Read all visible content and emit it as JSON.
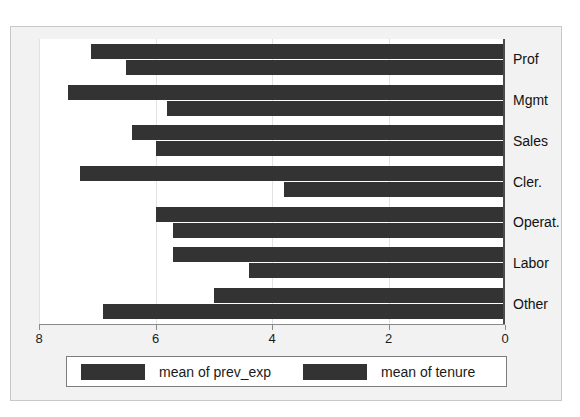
{
  "page": {
    "clipped_text_above": "of of of of of of"
  },
  "chart_data": {
    "type": "bar",
    "orientation": "horizontal",
    "title": "",
    "subtitle": "",
    "xlabel": "",
    "ylabel": "",
    "categories": [
      "Prof",
      "Mgmt",
      "Sales",
      "Cler.",
      "Operat.",
      "Labor",
      "Other"
    ],
    "series": [
      {
        "name": "mean of prev_exp",
        "color": "#333333",
        "values": [
          7.1,
          7.5,
          6.4,
          7.3,
          6.0,
          5.7,
          5.0
        ]
      },
      {
        "name": "mean of tenure",
        "color": "#333333",
        "values": [
          6.5,
          5.8,
          6.0,
          3.8,
          5.7,
          4.4,
          6.9
        ]
      }
    ],
    "xlim": [
      8,
      0
    ],
    "x_axis_reversed": true,
    "xticks": [
      8,
      6,
      4,
      2,
      0
    ],
    "xticklabels": [
      "8",
      "6",
      "4",
      "2",
      "0"
    ],
    "grid": "vertical",
    "legend_position": "bottom",
    "legend_entries": [
      "mean of prev_exp",
      "mean of tenure"
    ],
    "plot_background": "#ffffff",
    "outer_background": "#f2f2f2"
  }
}
